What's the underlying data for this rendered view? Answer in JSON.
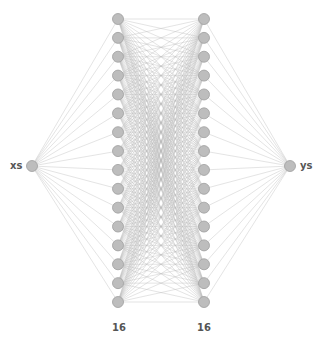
{
  "diagram": {
    "type": "neural-network",
    "input_label": "xs",
    "output_label": "ys",
    "layers": [
      {
        "name": "input",
        "units": 1
      },
      {
        "name": "hidden1",
        "units": 16,
        "label": "16"
      },
      {
        "name": "hidden2",
        "units": 16,
        "label": "16"
      },
      {
        "name": "output",
        "units": 1
      }
    ],
    "colors": {
      "node_fill": "#bdbdbd",
      "node_stroke": "#9e9e9e",
      "edge": "#bbbbbb",
      "text": "#555555"
    }
  }
}
